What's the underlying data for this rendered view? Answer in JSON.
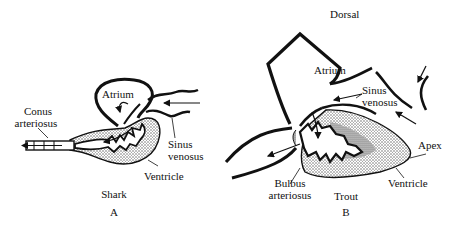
{
  "figure": {
    "panel_a": {
      "letter": "A",
      "organism": "Shark",
      "labels": {
        "atrium": "Atrium",
        "conus_line1": "Conus",
        "conus_line2": "arteriosus",
        "sinus_line1": "Sinus",
        "sinus_line2": "venosus",
        "ventricle": "Ventricle"
      }
    },
    "panel_b": {
      "letter": "B",
      "organism": "Trout",
      "labels": {
        "dorsal": "Dorsal",
        "atrium": "Atrium",
        "sinus_line1": "Sinus",
        "sinus_line2": "venosus",
        "apex": "Apex",
        "ventricle": "Ventricle",
        "bulbus_line1": "Bulbus",
        "bulbus_line2": "arteriosus"
      }
    },
    "colors": {
      "ink": "#111111",
      "stipple": "#9a9a9a",
      "background": "#ffffff"
    }
  }
}
